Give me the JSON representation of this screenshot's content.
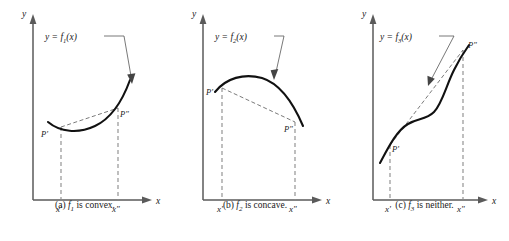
{
  "figure": {
    "type": "mathematical-diagram",
    "background_color": "#ffffff",
    "curve_color": "#111111",
    "axis_color": "#5a5a5a",
    "chord_color": "#6b6b6b",
    "dashed_drop_color": "#8a8a8a"
  },
  "panels": [
    {
      "id": "a",
      "caption_prefix": "(a)",
      "caption_func": "f",
      "caption_sub": "1",
      "caption_suffix": " is convex.",
      "caption_text": "(a) f1 is convex.",
      "function_label": "y = f",
      "function_sub": "1",
      "function_label_tail": "(x)",
      "function_label_text": "y = f1(x)",
      "y_axis_label": "y",
      "x_axis_label": "x",
      "tick_left": "x'",
      "tick_right": "x\"",
      "point_left": "P'",
      "point_right": "P\"",
      "shape": "convex",
      "chord_position": "above curve"
    },
    {
      "id": "b",
      "caption_prefix": "(b)",
      "caption_func": "f",
      "caption_sub": "2",
      "caption_suffix": " is concave.",
      "caption_text": "(b) f2 is concave.",
      "function_label": "y = f",
      "function_sub": "2",
      "function_label_tail": "(x)",
      "function_label_text": "y = f2(x)",
      "y_axis_label": "y",
      "x_axis_label": "x",
      "tick_left": "x'",
      "tick_right": "x\"",
      "point_left": "P'",
      "point_right": "P\"",
      "shape": "concave",
      "chord_position": "below curve"
    },
    {
      "id": "c",
      "caption_prefix": "(c)",
      "caption_func": "f",
      "caption_sub": "3",
      "caption_suffix": " is neither.",
      "caption_text": "(c) f3 is neither.",
      "function_label": "y = f",
      "function_sub": "3",
      "function_label_tail": "(x)",
      "function_label_text": "y = f3(x)",
      "y_axis_label": "y",
      "x_axis_label": "x",
      "tick_left": "x'",
      "tick_right": "x\"",
      "point_left": "P'",
      "point_right": "P\"",
      "shape": "sigmoid",
      "chord_position": "crosses curve"
    }
  ]
}
